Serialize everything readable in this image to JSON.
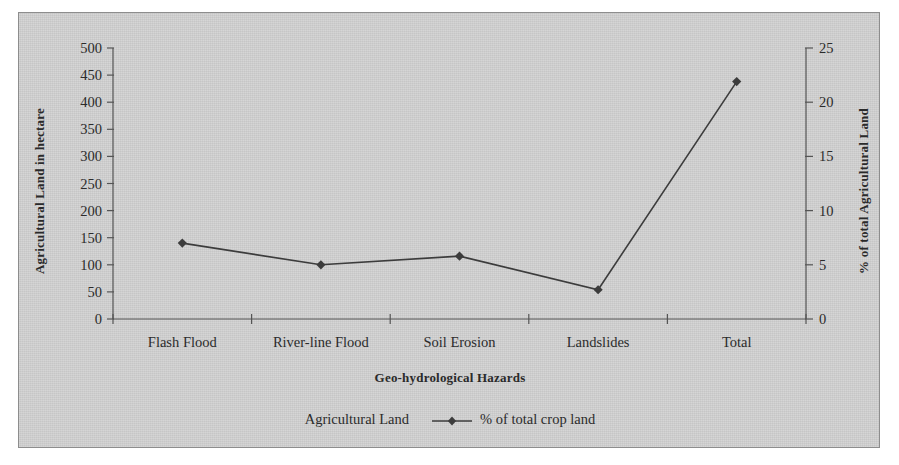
{
  "chart_data": {
    "type": "line",
    "title": "",
    "subtitle": "",
    "xlabel": "Geo-hydrological Hazards",
    "ylabel": "Agricultural Land in hectare",
    "ylabel_secondary": "% of total Agricultural Land",
    "categories": [
      "Flash Flood",
      "River-line Flood",
      "Soil Erosion",
      "Landslides",
      "Total"
    ],
    "ylim": [
      0,
      500
    ],
    "yticks": [
      0,
      50,
      100,
      150,
      200,
      250,
      300,
      350,
      400,
      450,
      500
    ],
    "ylim_secondary": [
      0,
      25
    ],
    "yticks_secondary": [
      0,
      5,
      10,
      15,
      20,
      25
    ],
    "grid": false,
    "legend_position": "bottom",
    "series": [
      {
        "name": "Agricultural Land",
        "type": "bar",
        "axis": "left",
        "values": [
          null,
          null,
          null,
          null,
          null
        ],
        "color": "#c8c8c8",
        "visible_in_plot": false
      },
      {
        "name": "% of total crop land",
        "type": "line",
        "axis": "secondary",
        "marker": "diamond",
        "color": "#3c3c3c",
        "values": [
          7.0,
          5.0,
          5.8,
          2.7,
          21.9
        ],
        "values_left_axis_equivalent": [
          139,
          100,
          116,
          54,
          438
        ]
      }
    ]
  },
  "legend": {
    "entries": [
      {
        "label": "Agricultural Land",
        "marker": "bar-swatch"
      },
      {
        "label": "% of total crop land",
        "marker": "line-diamond-marker"
      }
    ]
  },
  "axes": {
    "left": {
      "title": "Agricultural Land in hectare",
      "tick_labels": [
        "500",
        "450",
        "400",
        "350",
        "300",
        "250",
        "200",
        "150",
        "100",
        "50",
        "0"
      ]
    },
    "right": {
      "title": "% of total Agricultural Land",
      "tick_labels": [
        "25",
        "20",
        "15",
        "10",
        "5",
        "0"
      ]
    },
    "bottom": {
      "title": "Geo-hydrological Hazards",
      "tick_labels": [
        "Flash Flood",
        "River-line Flood",
        "Soil Erosion",
        "Landslides",
        "Total"
      ]
    }
  },
  "colors": {
    "figure_background": "#d2d2d2",
    "figure_border": "#8d8d8d",
    "axis": "#555555",
    "series_line": "#3c3c3c",
    "text": "#2b2b2b"
  }
}
